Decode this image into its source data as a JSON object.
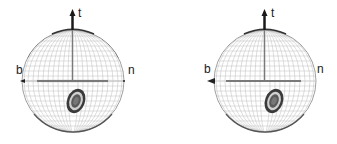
{
  "figure": {
    "panels": [
      {
        "id": "left",
        "axis_labels": {
          "tangent": "t",
          "binormal": "b",
          "normal": "n"
        },
        "sphere": {
          "cx": 73,
          "cy": 81,
          "r": 51
        },
        "distribution": {
          "cx": 76,
          "cy": 101,
          "rx": 8,
          "ry": 12,
          "rotate": 20
        }
      },
      {
        "id": "right",
        "axis_labels": {
          "tangent": "t",
          "binormal": "b",
          "normal": "n"
        },
        "sphere": {
          "cx": 97,
          "cy": 81,
          "r": 51
        },
        "distribution": {
          "cx": 106,
          "cy": 101,
          "rx": 8,
          "ry": 12,
          "rotate": 20
        }
      }
    ],
    "colors": {
      "grid": "#b8b8b8",
      "outline": "#555555",
      "axis": "#7a7a7a",
      "arrow": "#222222",
      "blob_outer": "#3a3a3a",
      "blob_ring": "#d0d0d0",
      "blob_core": "#555555"
    }
  }
}
